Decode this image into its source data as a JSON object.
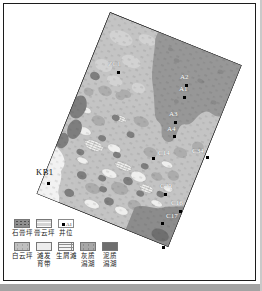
{
  "figure": {
    "type": "lithofacies-map",
    "background": "#ffffff",
    "border_color": "#1c1c1c",
    "scan_strip_color": "#a3a3a3"
  },
  "map": {
    "rotation_deg": 22,
    "zone_colors": {
      "base_gypsum_dolomite_flat": "#c4c4c4",
      "mud_lagoon_dark": "#979797",
      "limy_lagoon_medium": "#adadad",
      "dolomite_flat": "#c0c0c0",
      "shoal_belt_white": "#efefef",
      "dark_patches": "#7e7e7e",
      "bottom_dark_corner": "#8c8c8c",
      "white_corner": "#f2f2f2"
    }
  },
  "legend": {
    "row1": [
      {
        "label": "石膏坪",
        "swatch_color": "#8f8f8f",
        "swatch_texture": "speckled"
      },
      {
        "label": "膏云坪",
        "swatch_color": "#d4d4d4",
        "swatch_texture": "lined"
      },
      {
        "label": "井位",
        "swatch_color": "#ffffff",
        "marker": "black-square",
        "marker_label": "A1"
      }
    ],
    "row2": [
      {
        "label": "白云坪",
        "line1": "白云坪",
        "line2": "",
        "swatch_color": "#c0c0c0"
      },
      {
        "label": "滩发育带",
        "line1": "滩发",
        "line2": "育带",
        "swatch_color": "#ededed"
      },
      {
        "label": "生屑滩",
        "line1": "生屑滩",
        "line2": "",
        "swatch_color": "#f4f4f4",
        "swatch_texture": "brick"
      },
      {
        "label": "灰质潟湖",
        "line1": "灰质",
        "line2": "潟湖",
        "swatch_color": "#a7a7a7"
      },
      {
        "label": "泥质潟湖",
        "line1": "泥质",
        "line2": "潟湖",
        "swatch_color": "#6e6e6e"
      }
    ]
  },
  "wells": [
    {
      "id": "ZC1",
      "x": 118,
      "y": 72,
      "lx": 108,
      "ly": 61,
      "color": "#f2f2f2"
    },
    {
      "id": "A2",
      "x": 186,
      "y": 85,
      "lx": 180,
      "ly": 74,
      "color": "#ffffff"
    },
    {
      "id": "A1",
      "x": 184,
      "y": 97,
      "lx": 179,
      "ly": 86,
      "color": "#ffffff"
    },
    {
      "id": "A3",
      "x": 175,
      "y": 122,
      "lx": 169,
      "ly": 111,
      "color": "#ffffff"
    },
    {
      "id": "A4",
      "x": 174,
      "y": 136,
      "lx": 167,
      "ly": 126,
      "color": "#ffffff"
    },
    {
      "id": "C14",
      "x": 153,
      "y": 158,
      "lx": 158,
      "ly": 150,
      "color": "#ffffff"
    },
    {
      "id": "C34",
      "x": 207,
      "y": 157,
      "lx": 192,
      "ly": 148,
      "color": "#ffffff"
    },
    {
      "id": "C29",
      "x": 165,
      "y": 194,
      "lx": 160,
      "ly": 183,
      "color": "#ffffff"
    },
    {
      "id": "C16",
      "x": 180,
      "y": 211,
      "lx": 171,
      "ly": 200,
      "color": "#ffffff"
    },
    {
      "id": "C17",
      "x": 162,
      "y": 223,
      "lx": 166,
      "ly": 213,
      "color": "#ffffff"
    },
    {
      "id": "KB1",
      "x": 48,
      "y": 183,
      "lx": 36,
      "ly": 169,
      "color": "#111111"
    },
    {
      "id": "",
      "x": 163,
      "y": 247,
      "lx": 0,
      "ly": 0,
      "color": "#ffffff"
    }
  ]
}
